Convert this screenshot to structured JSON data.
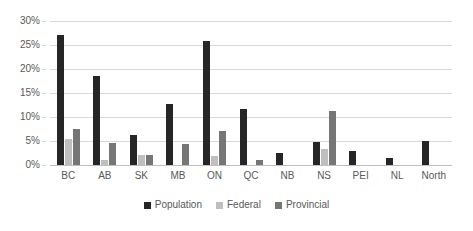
{
  "chart_data": {
    "type": "bar",
    "title": "",
    "xlabel": "",
    "ylabel": "",
    "ylim": [
      0,
      30
    ],
    "ytick_labels": [
      "0%",
      "5%",
      "10%",
      "15%",
      "20%",
      "25%",
      "30%"
    ],
    "ytick_values": [
      0,
      5,
      10,
      15,
      20,
      25,
      30
    ],
    "grid": "horizontal",
    "legend_position": "bottom-center",
    "categories": [
      "BC",
      "AB",
      "SK",
      "MB",
      "ON",
      "QC",
      "NB",
      "NS",
      "PEI",
      "NL",
      "North"
    ],
    "series": [
      {
        "name": "Population",
        "color": "#262626",
        "values": [
          27.0,
          18.5,
          6.2,
          12.8,
          25.8,
          11.7,
          2.5,
          4.8,
          3.0,
          1.4,
          5.0
        ]
      },
      {
        "name": "Federal",
        "color": "#bfbfbf",
        "values": [
          5.5,
          1.0,
          2.0,
          0.0,
          1.8,
          0.0,
          0.0,
          3.3,
          0.0,
          0.0,
          0.0
        ]
      },
      {
        "name": "Provincial",
        "color": "#767676",
        "values": [
          7.4,
          4.5,
          2.1,
          4.3,
          7.1,
          1.1,
          0.0,
          11.3,
          0.0,
          0.0,
          0.0
        ]
      }
    ]
  }
}
